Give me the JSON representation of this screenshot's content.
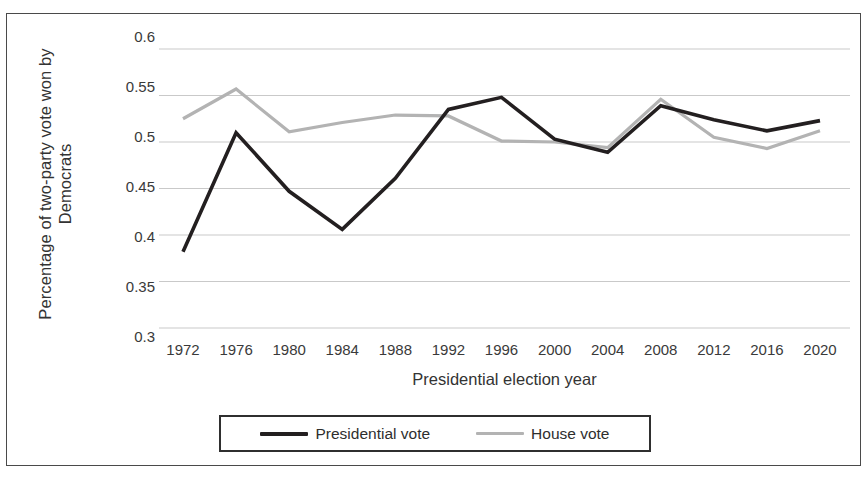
{
  "chart_data": {
    "type": "line",
    "title": "",
    "xlabel": "Presidential election year",
    "ylabel": "Percentage of two-party vote won by Democrats",
    "ylabel_line1": "Percentage of two-party vote won by",
    "ylabel_line2": "Democrats",
    "categories": [
      "1972",
      "1976",
      "1980",
      "1984",
      "1988",
      "1992",
      "1996",
      "2000",
      "2004",
      "2008",
      "2012",
      "2016",
      "2020"
    ],
    "x": [
      1972,
      1976,
      1980,
      1984,
      1988,
      1992,
      1996,
      2000,
      2004,
      2008,
      2012,
      2016,
      2020
    ],
    "series": [
      {
        "name": "Presidential vote",
        "color": "#231f20",
        "values": [
          0.382,
          0.51,
          0.447,
          0.406,
          0.461,
          0.535,
          0.548,
          0.503,
          0.489,
          0.539,
          0.524,
          0.512,
          0.523
        ]
      },
      {
        "name": "House vote",
        "color": "#b3b3b3",
        "values": [
          0.525,
          0.557,
          0.511,
          0.521,
          0.529,
          0.528,
          0.501,
          0.5,
          0.494,
          0.546,
          0.505,
          0.493,
          0.512
        ]
      }
    ],
    "ylim": [
      0.3,
      0.6
    ],
    "yticks": [
      "0.6",
      "0.55",
      "0.5",
      "0.45",
      "0.4",
      "0.35",
      "0.3"
    ],
    "ytick_values": [
      0.6,
      0.55,
      0.5,
      0.45,
      0.4,
      0.35,
      0.3
    ],
    "grid": true,
    "grid_color": "#c9c9c9",
    "legend_position": "bottom",
    "legend": [
      {
        "label": "Presidential vote",
        "color": "#231f20"
      },
      {
        "label": "House vote",
        "color": "#b3b3b3"
      }
    ]
  }
}
